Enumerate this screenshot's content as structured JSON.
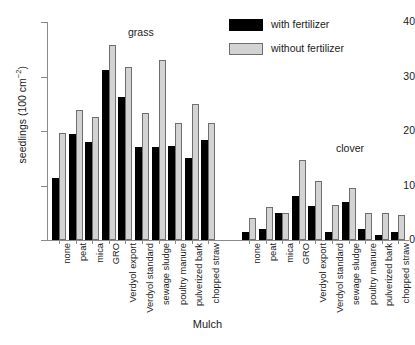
{
  "figure": {
    "top_cropped_text": "",
    "xtitle": "Mulch",
    "ytitle_main": "seedlings (100 cm",
    "ytitle_sup": "−2",
    "ytitle_close": ")"
  },
  "legend": {
    "position": "top-right",
    "items": [
      {
        "label": "with fertilizer",
        "color": "#000000",
        "key": "f"
      },
      {
        "label": "without fertilizer",
        "color": "#d3d3d3",
        "key": "nf"
      }
    ]
  },
  "groups": [
    {
      "name": "grass",
      "label": "grass"
    },
    {
      "name": "clover",
      "label": "clover"
    }
  ],
  "yaxis": {
    "ticks": [
      "0",
      "10",
      "20",
      "30",
      "40"
    ],
    "min": 0,
    "max": 40
  },
  "chart_data": {
    "type": "bar",
    "title": "",
    "xlabel": "Mulch",
    "ylabel": "seedlings (100 cm⁻²)",
    "ylim": [
      0,
      40
    ],
    "yticks": [
      0,
      10,
      20,
      30,
      40
    ],
    "grid": false,
    "legend_position": "top right",
    "legend_entries": [
      "with fertilizer",
      "without fertilizer"
    ],
    "annotations": [
      "grass",
      "clover"
    ],
    "categories": [
      "none",
      "peat",
      "mica",
      "GRO",
      "Verdyol export",
      "Verdyol standard",
      "sewage sludge",
      "poultry manure",
      "pulverized bark",
      "chopped straw"
    ],
    "panels": [
      {
        "group": "grass",
        "series": [
          {
            "name": "with fertilizer",
            "color": "#000000",
            "values": [
              11.3,
              19.5,
              18.0,
              31.2,
              26.3,
              17.0,
              17.0,
              17.2,
              15.0,
              18.3
            ]
          },
          {
            "name": "without fertilizer",
            "color": "#d3d3d3",
            "values": [
              19.6,
              23.8,
              22.5,
              35.8,
              31.7,
              23.3,
              33.0,
              21.5,
              25.0,
              21.5
            ]
          }
        ]
      },
      {
        "group": "clover",
        "series": [
          {
            "name": "with fertilizer",
            "color": "#000000",
            "values": [
              1.5,
              2.0,
              5.0,
              8.0,
              6.2,
              1.5,
              7.0,
              2.0,
              1.0,
              1.5
            ]
          },
          {
            "name": "without fertilizer",
            "color": "#d3d3d3",
            "values": [
              4.0,
              6.0,
              5.0,
              14.7,
              10.8,
              6.5,
              9.5,
              5.0,
              5.0,
              4.5
            ]
          }
        ]
      }
    ]
  }
}
